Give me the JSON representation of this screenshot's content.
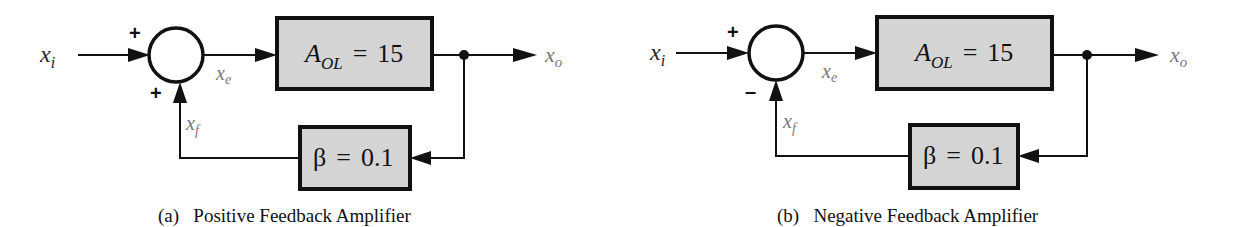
{
  "diagrams": [
    {
      "id": "a",
      "caption": "(a)   Positive Feedback Amplifier",
      "input_label": "x",
      "input_sub": "i",
      "error_label": "x",
      "error_sub": "e",
      "output_label": "x",
      "output_sub": "o",
      "feedback_label": "x",
      "feedback_sub": "f",
      "input_sign": "+",
      "feedback_sign": "+",
      "forward_block": {
        "symbol": "A",
        "sub": "OL",
        "eq": "=",
        "value": "15"
      },
      "feedback_block": {
        "symbol": "β",
        "eq": "=",
        "value": "0.1"
      }
    },
    {
      "id": "b",
      "caption": "(b)   Negative Feedback Amplifier",
      "input_label": "x",
      "input_sub": "i",
      "error_label": "x",
      "error_sub": "e",
      "output_label": "x",
      "output_sub": "o",
      "feedback_label": "x",
      "feedback_sub": "f",
      "input_sign": "+",
      "feedback_sign": "–",
      "forward_block": {
        "symbol": "A",
        "sub": "OL",
        "eq": "=",
        "value": "15"
      },
      "feedback_block": {
        "symbol": "β",
        "eq": "=",
        "value": "0.1"
      }
    }
  ]
}
